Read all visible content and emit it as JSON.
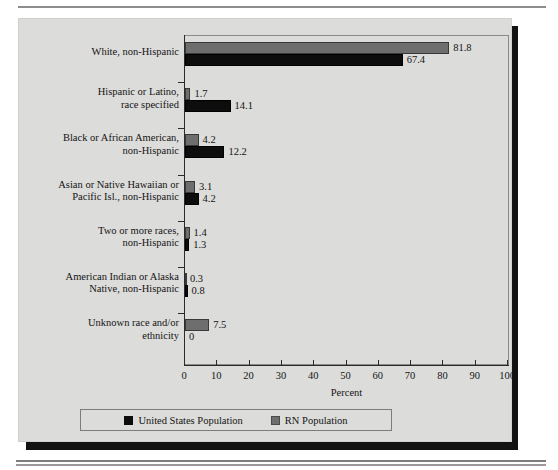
{
  "figure": {
    "background_color": "#dcdcda",
    "shadow_color": "#121212"
  },
  "chart_data": {
    "type": "bar",
    "orientation": "horizontal",
    "title": "",
    "xlabel": "Percent",
    "ylabel": "",
    "xlim": [
      0,
      100
    ],
    "xticks": [
      0,
      10,
      20,
      30,
      40,
      50,
      60,
      70,
      80,
      90,
      100
    ],
    "xtick_labels": [
      "0",
      "10",
      "20",
      "30",
      "40",
      "50",
      "60",
      "70",
      "80",
      "90",
      "100"
    ],
    "grid": false,
    "legend_position": "bottom",
    "categories": [
      "White, non-Hispanic",
      "Hispanic or Latino,\nrace specified",
      "Black or African American,\nnon-Hispanic",
      "Asian or Native Hawaiian or\nPacific Isl., non-Hispanic",
      "Two or more races,\nnon-Hispanic",
      "American Indian or Alaska\nNative, non-Hispanic",
      "Unknown race and/or\nethnicity"
    ],
    "series": [
      {
        "name": "RN Population",
        "color": "#6e6e6e",
        "values": [
          81.8,
          1.7,
          4.2,
          3.1,
          1.4,
          0.3,
          7.5
        ],
        "labels": [
          "81.8",
          "1.7",
          "4.2",
          "3.1",
          "1.4",
          "0.3",
          "7.5"
        ]
      },
      {
        "name": "United States Population",
        "color": "#0d0d0d",
        "values": [
          67.4,
          14.1,
          12.2,
          4.2,
          1.3,
          0.8,
          0
        ],
        "labels": [
          "67.4",
          "14.1",
          "12.2",
          "4.2",
          "1.3",
          "0.8",
          "0"
        ]
      }
    ],
    "legend": [
      {
        "label": "United States Population",
        "swatch": "us"
      },
      {
        "label": "RN Population",
        "swatch": "rn"
      }
    ]
  }
}
